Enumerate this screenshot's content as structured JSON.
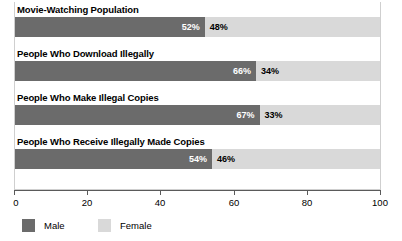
{
  "chart_data": {
    "type": "bar",
    "orientation": "horizontal",
    "stacked": true,
    "title": "",
    "xlabel": "",
    "ylabel": "",
    "xlim": [
      0,
      100
    ],
    "xticks": [
      0,
      20,
      40,
      60,
      80,
      100
    ],
    "xtick_labels": [
      "0",
      "20",
      "40",
      "60",
      "80",
      "100"
    ],
    "grid": false,
    "legend_position": "bottom-left",
    "categories": [
      "Movie-Watching Population",
      "People Who Download Illegally",
      "People Who Make Illegal Copies",
      "People Who Receive Illegally Made Copies"
    ],
    "series": [
      {
        "name": "Male",
        "color": "#6b6b6b",
        "values": [
          52,
          66,
          67,
          54
        ]
      },
      {
        "name": "Female",
        "color": "#d9d9d9",
        "values": [
          48,
          34,
          33,
          46
        ]
      }
    ],
    "data_labels": [
      {
        "category": "Movie-Watching Population",
        "male": "52%",
        "female": "48%"
      },
      {
        "category": "People Who Download Illegally",
        "male": "66%",
        "female": "34%"
      },
      {
        "category": "People Who Make Illegal Copies",
        "male": "67%",
        "female": "33%"
      },
      {
        "category": "People Who Receive Illegally Made Copies",
        "male": "54%",
        "female": "46%"
      }
    ]
  },
  "rows": [
    {
      "label": "Movie-Watching Population",
      "male": 52,
      "female": 48,
      "male_label": "52%",
      "female_label": "48%"
    },
    {
      "label": "People Who Download Illegally",
      "male": 66,
      "female": 34,
      "male_label": "66%",
      "female_label": "34%"
    },
    {
      "label": "People Who Make Illegal Copies",
      "male": 67,
      "female": 33,
      "male_label": "67%",
      "female_label": "33%"
    },
    {
      "label": "People Who Receive Illegally Made Copies",
      "male": 54,
      "female": 46,
      "male_label": "54%",
      "female_label": "46%"
    }
  ],
  "axis": {
    "ticks": [
      "0",
      "20",
      "40",
      "60",
      "80",
      "100"
    ]
  },
  "legend": {
    "male": "Male",
    "female": "Female"
  },
  "colors": {
    "male": "#6b6b6b",
    "female": "#d9d9d9",
    "axis": "#5a5a5a",
    "frame": "#cfcfcf"
  }
}
